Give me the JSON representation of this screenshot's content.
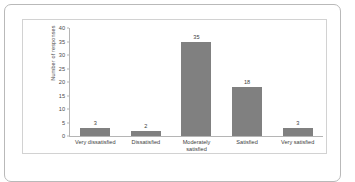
{
  "chart_data": {
    "type": "bar",
    "title": "",
    "subtitle": "",
    "xlabel": "",
    "ylabel": "Number of responses",
    "categories": [
      "Very dissatisfied",
      "Moderately satisfied",
      "Dissatisfied",
      "Satisfied",
      "Very satisfied"
    ],
    "category_lines": [
      [
        "Very dissatisfied"
      ],
      [
        "Dissatisfied"
      ],
      [
        "Moderately",
        "satisfied"
      ],
      [
        "Satisfied"
      ],
      [
        "Very satisfied"
      ]
    ],
    "ordered_categories": [
      "Very dissatisfied",
      "Dissatisfied",
      "Moderately satisfied",
      "Satisfied",
      "Very satisfied"
    ],
    "values": [
      3,
      2,
      35,
      18,
      3
    ],
    "data_labels": [
      "3",
      "2",
      "35",
      "18",
      "3"
    ],
    "ylim": [
      0,
      40
    ],
    "yticks": [
      0,
      5,
      10,
      15,
      20,
      25,
      30,
      35,
      40
    ],
    "ytick_labels": [
      "0",
      "5",
      "10",
      "15",
      "20",
      "25",
      "30",
      "35",
      "40"
    ],
    "grid": false,
    "legend": false,
    "legend_position": "none",
    "bar_color": "#808080",
    "axis_color": "#b5b5b5",
    "text_color": "#3d3d3d",
    "background": "#ffffff",
    "frame_color": "#b9b9b9",
    "panel_border_color": "#d2d2d2"
  }
}
